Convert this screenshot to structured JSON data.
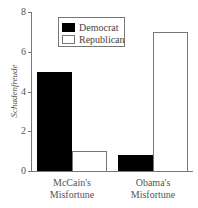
{
  "chart_data": {
    "type": "bar",
    "title": "",
    "xlabel": "",
    "ylabel": "Schadenfreude",
    "ylim": [
      0,
      8
    ],
    "yticks": [
      "0",
      "2",
      "4",
      "6",
      "8"
    ],
    "categories": [
      "McCain's Misfortune",
      "Obama's Misfortune"
    ],
    "category_lines": [
      [
        "McCain's",
        "Misfortune"
      ],
      [
        "Obama's",
        "Misfortune"
      ]
    ],
    "series": [
      {
        "name": "Democrat",
        "color": "#000000",
        "values": [
          5.0,
          0.8
        ]
      },
      {
        "name": "Republican",
        "color": "#ffffff",
        "values": [
          1.0,
          7.0
        ]
      }
    ],
    "grid": false,
    "legend_position": "upper left"
  }
}
